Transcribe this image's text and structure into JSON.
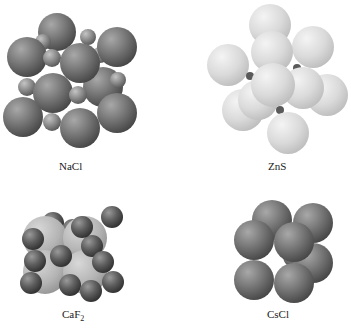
{
  "figure": {
    "structures": [
      {
        "id": "nacl",
        "label": "NaCl",
        "subscript": ""
      },
      {
        "id": "zns",
        "label": "ZnS",
        "subscript": ""
      },
      {
        "id": "caf2",
        "label": "CaF",
        "subscript": "2"
      },
      {
        "id": "cscl",
        "label": "CsCl",
        "subscript": ""
      }
    ]
  },
  "colors": {
    "dark_sphere": "#6e6e6e",
    "light_sphere": "#d8d8d8",
    "caf2_large": "#bdbdbd",
    "background": "#ffffff",
    "text": "#1a1a1a"
  }
}
